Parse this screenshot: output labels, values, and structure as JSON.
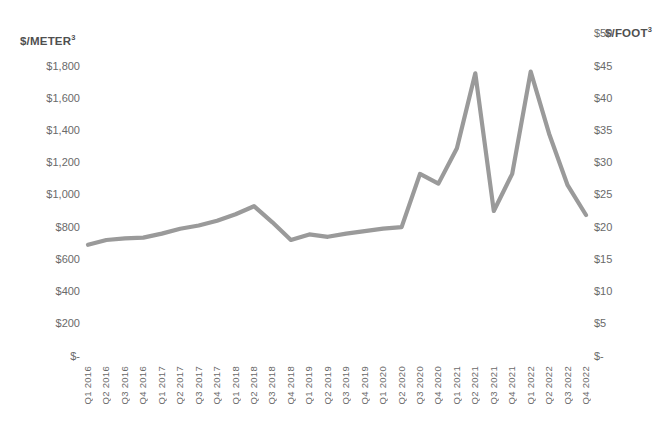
{
  "chart_data": {
    "type": "line",
    "title": "",
    "xlabel": "",
    "ylabel": "$/METER³",
    "y2label": "$/FOOT³",
    "grid": false,
    "legend": "none",
    "line_color": "#9a9a9a",
    "background": "#ffffff",
    "ylim": [
      0,
      1800
    ],
    "y2lim": [
      0,
      50
    ],
    "yticks": [
      "$-",
      "$200",
      "$400",
      "$600",
      "$800",
      "$1,000",
      "$1,200",
      "$1,400",
      "$1,600",
      "$1,800"
    ],
    "y2ticks": [
      "$-",
      "$5",
      "$10",
      "$15",
      "$20",
      "$25",
      "$30",
      "$35",
      "$40",
      "$45",
      "$50"
    ],
    "categories": [
      "Q1 2016",
      "Q2 2016",
      "Q3 2016",
      "Q4 2016",
      "Q1 2017",
      "Q2 2017",
      "Q3 2017",
      "Q4 2017",
      "Q1 2018",
      "Q2 2018",
      "Q3 2018",
      "Q4 2018",
      "Q1 2019",
      "Q2 2019",
      "Q3 2019",
      "Q4 2019",
      "Q1 2020",
      "Q2 2020",
      "Q3 2020",
      "Q4 2020",
      "Q1 2021",
      "Q2 2021",
      "Q3 2021",
      "Q4 2021",
      "Q1 2022",
      "Q2 2022",
      "Q3 2022",
      "Q4 2022"
    ],
    "values": [
      690,
      720,
      730,
      735,
      760,
      790,
      810,
      840,
      880,
      930,
      830,
      720,
      755,
      740,
      760,
      775,
      790,
      800,
      1130,
      1070,
      1290,
      1755,
      900,
      1130,
      1765,
      1380,
      1060,
      875
    ],
    "units": "$/meter³"
  },
  "axes": {
    "left_title": "$/METER",
    "left_title_sup": "3",
    "right_title": "$/FOOT",
    "right_title_sup": "3"
  }
}
